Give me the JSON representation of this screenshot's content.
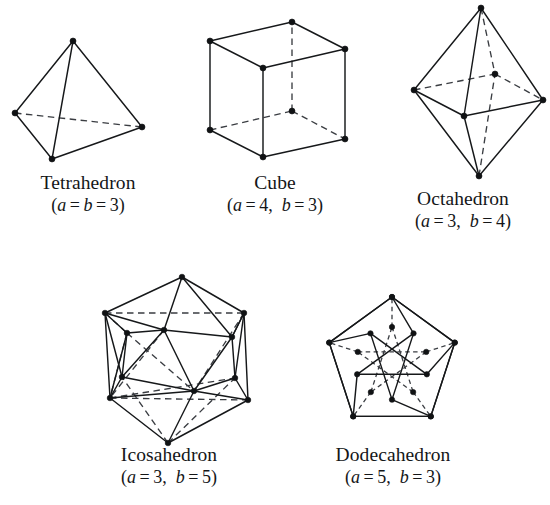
{
  "figure": {
    "kind": "platonic-solids-wireframe-plate",
    "background_color": "#ffffff",
    "edge_color": "#16181a",
    "hidden_edge_color": "#3a3d42",
    "vertex_color": "#101214",
    "solids": [
      {
        "id": "tetrahedron",
        "name": "Tetrahedron",
        "params_prefix": "(",
        "a_symbol": "a",
        "a_eq": " = ",
        "a_value": "",
        "b_symbol": "b",
        "b_eq": " = ",
        "b_value": "3",
        "params_text": "(a = b = 3)",
        "a": 3,
        "b": 3,
        "faces": 4,
        "edges": 6,
        "vertices": 4
      },
      {
        "id": "cube",
        "name": "Cube",
        "params_text": "(a = 4, b = 3)",
        "a": 4,
        "b": 3,
        "faces": 6,
        "edges": 12,
        "vertices": 8
      },
      {
        "id": "octahedron",
        "name": "Octahedron",
        "params_text": "(a = 3, b = 4)",
        "a": 3,
        "b": 4,
        "faces": 8,
        "edges": 12,
        "vertices": 6
      },
      {
        "id": "icosahedron",
        "name": "Icosahedron",
        "params_text": "(a = 3, b = 5)",
        "a": 3,
        "b": 5,
        "faces": 20,
        "edges": 30,
        "vertices": 12
      },
      {
        "id": "dodecahedron",
        "name": "Dodecahedron",
        "params_text": "(a = 5, b = 3)",
        "a": 5,
        "b": 3,
        "faces": 12,
        "edges": 30,
        "vertices": 20
      }
    ]
  },
  "captions": {
    "tetrahedron": {
      "name": "Tetrahedron",
      "open": "(",
      "v1": "a",
      "eq1": " = ",
      "v2": "b",
      "eq2": " = ",
      "val": "3",
      "close": ")"
    },
    "cube": {
      "name": "Cube",
      "open": "(",
      "v1": "a",
      "eq1": " = 4, ",
      "v2": "b",
      "eq2": " = 3",
      "close": ")"
    },
    "octahedron": {
      "name": "Octahedron",
      "open": "(",
      "v1": "a",
      "eq1": " = 3, ",
      "v2": "b",
      "eq2": " = 4",
      "close": ")"
    },
    "icosahedron": {
      "name": "Icosahedron",
      "open": "(",
      "v1": "a",
      "eq1": " = 3, ",
      "v2": "b",
      "eq2": " = 5",
      "close": ")"
    },
    "dodecahedron": {
      "name": "Dodecahedron",
      "open": "(",
      "v1": "a",
      "eq1": " = 5, ",
      "v2": "b",
      "eq2": " = 3",
      "close": ")"
    }
  },
  "geometry": {
    "tetrahedron": {
      "vertices": {
        "apex": [
          73,
          41
        ],
        "left": [
          15,
          113
        ],
        "right": [
          142,
          127
        ],
        "bottom": [
          52,
          159
        ]
      },
      "solid_edges": [
        [
          "apex",
          "left"
        ],
        [
          "apex",
          "right"
        ],
        [
          "apex",
          "bottom"
        ],
        [
          "left",
          "bottom"
        ],
        [
          "bottom",
          "right"
        ]
      ],
      "hidden_edges": [
        [
          "left",
          "right"
        ]
      ],
      "dot_r": 3.0
    },
    "cube": {
      "vertices": {
        "ftl": [
          210,
          41
        ],
        "ftr": [
          263,
          68
        ],
        "fbl": [
          210,
          130
        ],
        "fbr": [
          263,
          157
        ],
        "btl": [
          292,
          22
        ],
        "btr": [
          345,
          49
        ],
        "bbl": [
          292,
          111
        ],
        "bbr": [
          345,
          139
        ]
      },
      "solid_edges": [
        [
          "ftl",
          "ftr"
        ],
        [
          "ftl",
          "fbl"
        ],
        [
          "ftr",
          "fbr"
        ],
        [
          "fbl",
          "fbr"
        ],
        [
          "ftl",
          "btl"
        ],
        [
          "ftr",
          "btr"
        ],
        [
          "fbr",
          "bbr"
        ],
        [
          "btl",
          "btr"
        ],
        [
          "btr",
          "bbr"
        ]
      ],
      "hidden_edges": [
        [
          "fbl",
          "bbl"
        ],
        [
          "bbl",
          "btl"
        ],
        [
          "bbl",
          "bbr"
        ]
      ],
      "dot_r": 3.0
    },
    "octahedron": {
      "vertices": {
        "top": [
          481,
          8
        ],
        "bottom": [
          479,
          176
        ],
        "left": [
          414,
          90
        ],
        "right": [
          543,
          100
        ],
        "front": [
          464,
          116
        ],
        "back": [
          495,
          74
        ]
      },
      "solid_edges": [
        [
          "top",
          "left"
        ],
        [
          "top",
          "right"
        ],
        [
          "top",
          "front"
        ],
        [
          "bottom",
          "left"
        ],
        [
          "bottom",
          "right"
        ],
        [
          "bottom",
          "front"
        ],
        [
          "left",
          "front"
        ],
        [
          "front",
          "right"
        ]
      ],
      "hidden_edges": [
        [
          "top",
          "back"
        ],
        [
          "bottom",
          "back"
        ],
        [
          "left",
          "back"
        ],
        [
          "back",
          "right"
        ]
      ],
      "dot_r": 3.0
    },
    "icosahedron": {
      "vertices": {
        "top": [
          182,
          277
        ],
        "bottom": [
          168,
          443
        ],
        "u1": [
          105,
          313
        ],
        "u2": [
          164,
          330
        ],
        "u3": [
          232,
          337
        ],
        "u4": [
          244,
          313
        ],
        "u5": [
          127,
          333
        ],
        "l1": [
          110,
          398
        ],
        "l2": [
          122,
          377
        ],
        "l3": [
          194,
          391
        ],
        "l4": [
          235,
          378
        ],
        "l5": [
          248,
          400
        ]
      },
      "solid_edges": [
        [
          "top",
          "u1"
        ],
        [
          "top",
          "u2"
        ],
        [
          "top",
          "u3"
        ],
        [
          "top",
          "u4"
        ],
        [
          "u1",
          "u5"
        ],
        [
          "u5",
          "u2"
        ],
        [
          "u2",
          "u3"
        ],
        [
          "u3",
          "u4"
        ],
        [
          "u1",
          "l1"
        ],
        [
          "u1",
          "l2"
        ],
        [
          "u5",
          "l2"
        ],
        [
          "u2",
          "l2"
        ],
        [
          "u2",
          "l3"
        ],
        [
          "u3",
          "l3"
        ],
        [
          "u3",
          "l4"
        ],
        [
          "u4",
          "l4"
        ],
        [
          "u4",
          "l5"
        ],
        [
          "l2",
          "l3"
        ],
        [
          "l3",
          "l4"
        ],
        [
          "l1",
          "l2"
        ],
        [
          "l4",
          "l5"
        ],
        [
          "l1",
          "l3"
        ],
        [
          "l3",
          "l5"
        ],
        [
          "bottom",
          "l1"
        ],
        [
          "bottom",
          "l3"
        ],
        [
          "bottom",
          "l5"
        ],
        [
          "u1",
          "u2"
        ],
        [
          "u5",
          "l1"
        ],
        [
          "u4",
          "u3"
        ]
      ],
      "hidden_edges": [
        [
          "u1",
          "u4"
        ],
        [
          "u1",
          "u5"
        ],
        [
          "l1",
          "l5"
        ],
        [
          "u5",
          "l1"
        ],
        [
          "u5",
          "l3"
        ],
        [
          "u2",
          "l1"
        ],
        [
          "u4",
          "l3"
        ],
        [
          "l1",
          "l4"
        ],
        [
          "bottom",
          "l2"
        ],
        [
          "bottom",
          "l4"
        ]
      ],
      "dot_r": 2.8
    },
    "dodecahedron": {
      "outer": {
        "cx": 392,
        "cy": 363,
        "r": 66,
        "rotation_deg": -90
      },
      "dot_r": 2.7
    }
  }
}
